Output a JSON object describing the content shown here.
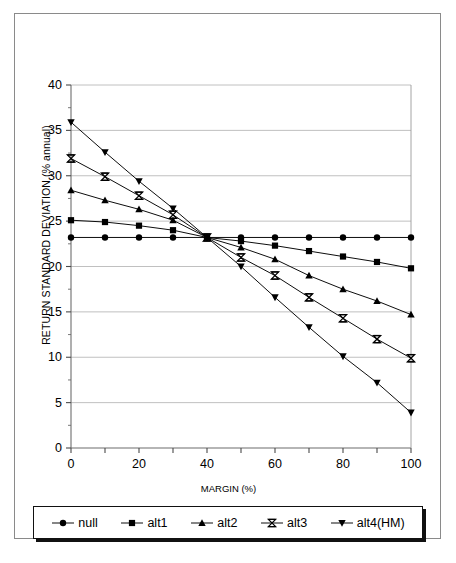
{
  "chart_data": {
    "type": "line",
    "title": "",
    "xlabel": "MARGIN (%)",
    "ylabel": "RETURN STANDARD DEVIATION (% annual)",
    "xlim": [
      0,
      100
    ],
    "ylim": [
      0,
      40
    ],
    "xticks": [
      0,
      10,
      20,
      30,
      40,
      50,
      60,
      70,
      80,
      90,
      100
    ],
    "xticklabels": [
      "0",
      "",
      "20",
      "",
      "40",
      "",
      "60",
      "",
      "80",
      "",
      "100"
    ],
    "yticks": [
      0,
      5,
      10,
      15,
      20,
      25,
      30,
      35,
      40
    ],
    "yticklabels": [
      "0",
      "5",
      "10",
      "15",
      "20",
      "25",
      "30",
      "35",
      "40"
    ],
    "grid": "horizontal",
    "legend_position": "below-plot",
    "x": [
      0,
      10,
      20,
      30,
      40,
      50,
      60,
      70,
      80,
      90,
      100
    ],
    "series": [
      {
        "name": "null",
        "marker": "circle",
        "color": "#000000",
        "values": [
          23.2,
          23.2,
          23.2,
          23.2,
          23.2,
          23.2,
          23.2,
          23.2,
          23.2,
          23.2,
          23.2
        ]
      },
      {
        "name": "alt1",
        "marker": "square",
        "color": "#000000",
        "values": [
          25.1,
          24.9,
          24.5,
          24.0,
          23.2,
          22.8,
          22.3,
          21.7,
          21.1,
          20.5,
          19.8
        ]
      },
      {
        "name": "alt2",
        "marker": "triangle-up",
        "color": "#000000",
        "values": [
          28.4,
          27.3,
          26.3,
          25.1,
          23.2,
          22.1,
          20.8,
          19.0,
          17.5,
          16.2,
          14.7
        ]
      },
      {
        "name": "alt3",
        "marker": "bowtie-x",
        "color": "#000000",
        "values": [
          31.9,
          29.9,
          27.8,
          25.7,
          23.2,
          21.0,
          19.0,
          16.6,
          14.3,
          12.0,
          9.9
        ]
      },
      {
        "name": "alt4(HM)",
        "marker": "triangle-down",
        "color": "#000000",
        "values": [
          35.9,
          32.6,
          29.4,
          26.4,
          23.2,
          20.0,
          16.6,
          13.3,
          10.1,
          7.2,
          3.9
        ]
      }
    ]
  },
  "legend": {
    "items": [
      {
        "label": "null",
        "marker": "circle"
      },
      {
        "label": "alt1",
        "marker": "square"
      },
      {
        "label": "alt2",
        "marker": "triangle-up"
      },
      {
        "label": "alt3",
        "marker": "bowtie-x"
      },
      {
        "label": "alt4(HM)",
        "marker": "triangle-down"
      }
    ]
  }
}
